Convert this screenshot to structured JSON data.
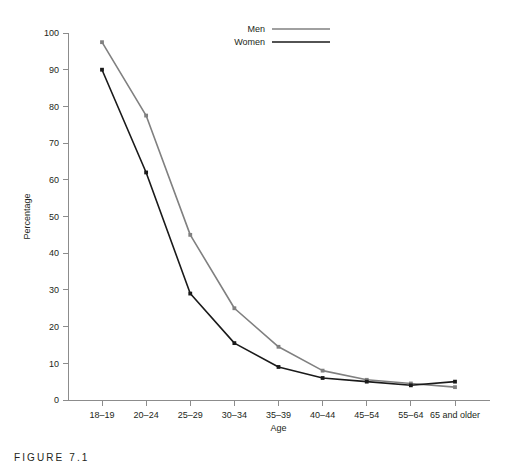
{
  "caption": {
    "text": "FIGURE 7.1"
  },
  "legend": {
    "position": "top-right",
    "entries": [
      {
        "label": "Men",
        "color": "#808080"
      },
      {
        "label": "Women",
        "color": "#1a1a1a"
      }
    ]
  },
  "chart_data": {
    "type": "line",
    "title": "",
    "xlabel": "Age",
    "ylabel": "Percentage",
    "categories": [
      "18–19",
      "20–24",
      "25–29",
      "30–34",
      "35–39",
      "40–44",
      "45–54",
      "55–64",
      "65 and older"
    ],
    "series": [
      {
        "name": "Men",
        "color": "#808080",
        "values": [
          97.5,
          77.5,
          45,
          25,
          14.5,
          8,
          5.5,
          4.5,
          3.5
        ]
      },
      {
        "name": "Women",
        "color": "#1a1a1a",
        "values": [
          90,
          62,
          29,
          15.5,
          9,
          6,
          5,
          4,
          5
        ]
      }
    ],
    "ylim": [
      0,
      100
    ],
    "yticks": [
      0,
      10,
      20,
      30,
      40,
      50,
      60,
      70,
      80,
      90,
      100
    ],
    "grid": false,
    "markers": true
  }
}
